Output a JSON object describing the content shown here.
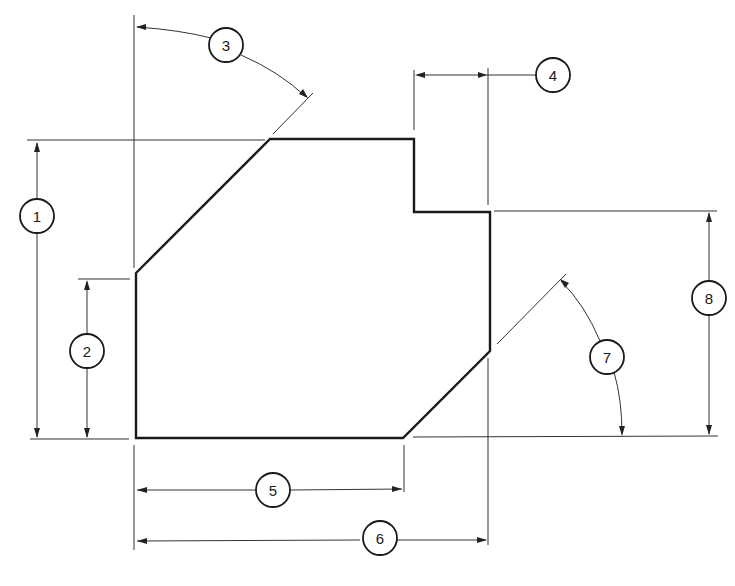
{
  "drawing": {
    "type": "dimensioning exercise",
    "callouts": [
      {
        "id": "1",
        "label": "1",
        "kind": "vertical linear",
        "description": "overall height"
      },
      {
        "id": "2",
        "label": "2",
        "kind": "vertical linear",
        "description": "left side height"
      },
      {
        "id": "3",
        "label": "3",
        "kind": "angular",
        "description": "upper chamfer angle from vertical"
      },
      {
        "id": "4",
        "label": "4",
        "kind": "horizontal linear",
        "description": "step width"
      },
      {
        "id": "5",
        "label": "5",
        "kind": "horizontal linear",
        "description": "bottom edge length"
      },
      {
        "id": "6",
        "label": "6",
        "kind": "horizontal linear",
        "description": "overall width"
      },
      {
        "id": "7",
        "label": "7",
        "kind": "angular",
        "description": "lower chamfer angle from horizontal"
      },
      {
        "id": "8",
        "label": "8",
        "kind": "vertical linear",
        "description": "right side height"
      }
    ],
    "colors": {
      "line": "#1a1a1a",
      "background": "#ffffff"
    }
  }
}
